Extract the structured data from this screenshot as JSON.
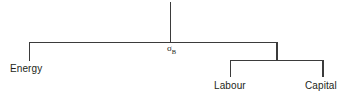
{
  "diagram": {
    "type": "nesting-tree",
    "background_color": "#ffffff",
    "line_color": "#3b3b3b",
    "text_color": "#231f20",
    "nodes": {
      "energy": "Energy",
      "labour": "Labour",
      "capital": "Capital"
    },
    "substitution_parameter": {
      "symbol": "σ",
      "subscript": "B",
      "full": "σB"
    }
  }
}
